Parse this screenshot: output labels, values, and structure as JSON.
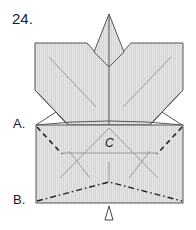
{
  "step": {
    "number": "24."
  },
  "labels": {
    "a": "A.",
    "b": "B.",
    "c": "C"
  },
  "colors": {
    "paper_fill": "#e2e2e2",
    "stripe": "#cfcfcf",
    "outline": "#555555",
    "crease": "#9a9a9a",
    "fold_line": "#222222"
  },
  "diagram": {
    "fold_lines": [
      {
        "id": "A",
        "style": "dashed",
        "type": "valley fold"
      },
      {
        "id": "B",
        "style": "dash-dot",
        "type": "mountain fold"
      }
    ],
    "arrow": "open-triangle-up"
  }
}
